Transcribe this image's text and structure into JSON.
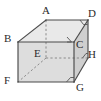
{
  "figure": {
    "kind": "geometry-diagram",
    "shape_name": "rectangular-prism",
    "canvas": {
      "width": 101,
      "height": 101
    },
    "background_color": "#ffffff",
    "stroke_color": "#4a4a4a",
    "hidden_stroke_color": "#7d7d7d",
    "face_fill_front": "#dcdcdc",
    "face_fill_top": "#e8e8e8",
    "face_fill_right": "#cfcfcf",
    "label_color": "#2b2b2b",
    "vertices": [
      {
        "id": "A",
        "label": "A",
        "x": 46,
        "y": 20,
        "label_x": 42,
        "label_y": 6,
        "hidden": false
      },
      {
        "id": "B",
        "label": "B",
        "x": 18,
        "y": 42,
        "label_x": 5,
        "label_y": 34,
        "hidden": false
      },
      {
        "id": "C",
        "label": "C",
        "x": 74,
        "y": 42,
        "label_x": 76,
        "label_y": 40,
        "hidden": false
      },
      {
        "id": "D",
        "label": "D",
        "x": 88,
        "y": 20,
        "label_x": 88,
        "label_y": 9,
        "hidden": false
      },
      {
        "id": "E",
        "label": "E",
        "x": 46,
        "y": 58,
        "label_x": 34,
        "label_y": 49,
        "hidden": true
      },
      {
        "id": "F",
        "label": "F",
        "x": 18,
        "y": 82,
        "label_x": 5,
        "label_y": 76,
        "hidden": false
      },
      {
        "id": "G",
        "label": "G",
        "x": 74,
        "y": 82,
        "label_x": 76,
        "label_y": 82,
        "hidden": false
      },
      {
        "id": "H",
        "label": "H",
        "x": 88,
        "y": 58,
        "label_x": 88,
        "label_y": 50,
        "hidden": false
      }
    ],
    "solid_edges": [
      "A-B",
      "A-D",
      "B-C",
      "C-D",
      "B-F",
      "C-G",
      "D-H",
      "F-G",
      "G-H"
    ],
    "hidden_edges": [
      "A-E",
      "E-F",
      "E-H"
    ],
    "right_angle_marks": [
      {
        "at": "D",
        "note": "right-angle mark inside top-right corner"
      },
      {
        "at": "C",
        "note": "right-angle mark at C on back upper edge"
      },
      {
        "at": "H",
        "note": "right-angle mark at H on right face"
      },
      {
        "at": "G",
        "note": "right-angle mark inside bottom-right corner"
      }
    ]
  }
}
